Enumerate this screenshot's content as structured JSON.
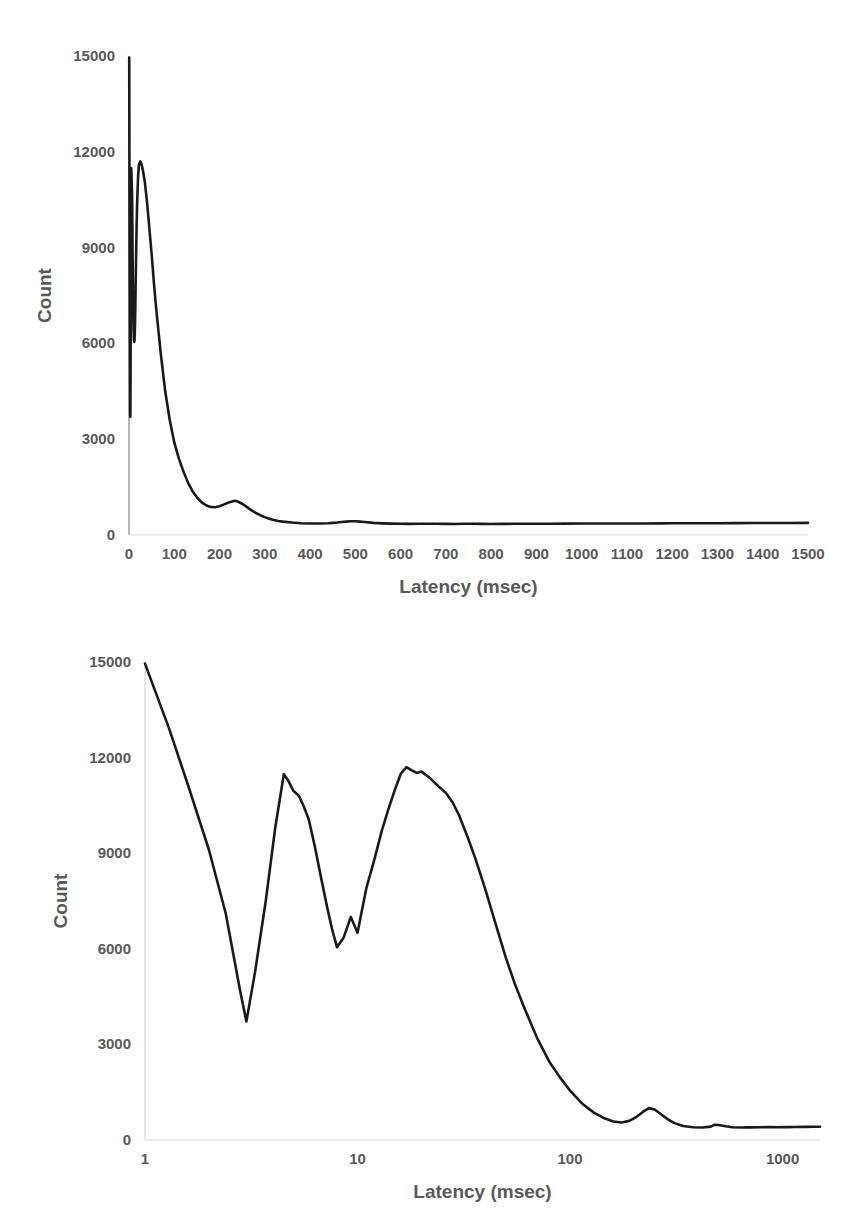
{
  "figures": {
    "top": {
      "name": "latency-histogram-linear",
      "ylabel": "Count",
      "xlabel": "Latency (msec)",
      "y_ticks": [
        "0",
        "3000",
        "6000",
        "9000",
        "12000",
        "15000"
      ],
      "x_ticks": [
        "0",
        "100",
        "200",
        "300",
        "400",
        "500",
        "600",
        "700",
        "800",
        "900",
        "1000",
        "1100",
        "1200",
        "1300",
        "1400",
        "1500"
      ]
    },
    "bottom": {
      "name": "latency-histogram-log",
      "ylabel": "Count",
      "xlabel": "Latency (msec)",
      "y_ticks": [
        "0",
        "3000",
        "6000",
        "9000",
        "12000",
        "15000"
      ],
      "x_ticks": [
        "1",
        "10",
        "100",
        "1000"
      ]
    }
  },
  "colors": {
    "curve": "#1a1a1a",
    "axis": "#868686",
    "axis_faint": "#d9d9d9",
    "text": "#595959",
    "background": "#ffffff"
  },
  "chart_data": [
    {
      "type": "line",
      "id": "latency-histogram-linear",
      "title": "",
      "xlabel": "Latency (msec)",
      "ylabel": "Count",
      "xscale": "linear",
      "yscale": "linear",
      "xlim": [
        0,
        1500
      ],
      "ylim": [
        0,
        15000
      ],
      "xticks": [
        0,
        100,
        200,
        300,
        400,
        500,
        600,
        700,
        800,
        900,
        1000,
        1100,
        1200,
        1300,
        1400,
        1500
      ],
      "yticks": [
        0,
        3000,
        6000,
        9000,
        12000,
        15000
      ],
      "grid": false,
      "legend": null,
      "series": [
        {
          "name": "Count vs Latency (linear axis)",
          "x": [
            0.5,
            1,
            1.5,
            2,
            2.5,
            3,
            3.5,
            4,
            4.5,
            5,
            5.5,
            6,
            6.5,
            7,
            7.5,
            8,
            9,
            10,
            11,
            12,
            13,
            14,
            15,
            16,
            17,
            18,
            20,
            22,
            25,
            28,
            31,
            35,
            40,
            45,
            50,
            55,
            60,
            70,
            80,
            90,
            100,
            110,
            120,
            130,
            140,
            150,
            160,
            170,
            180,
            190,
            200,
            210,
            220,
            230,
            235,
            240,
            250,
            260,
            270,
            280,
            290,
            300,
            310,
            320,
            330,
            340,
            360,
            380,
            400,
            420,
            440,
            450,
            460,
            470,
            480,
            490,
            500,
            510,
            520,
            540,
            560,
            580,
            600,
            620,
            640,
            660,
            680,
            700,
            720,
            740,
            760,
            780,
            800,
            820,
            850,
            880,
            900,
            930,
            960,
            1000,
            1040,
            1080,
            1100,
            1140,
            1180,
            1200,
            1240,
            1280,
            1300,
            1340,
            1380,
            1420,
            1460,
            1500
          ],
          "y": [
            14950,
            11200,
            8100,
            5950,
            3750,
            3700,
            5200,
            7600,
            10100,
            11480,
            11300,
            10950,
            10800,
            10400,
            9600,
            8700,
            7300,
            6500,
            6100,
            6050,
            6400,
            7200,
            8100,
            9000,
            9800,
            10400,
            11200,
            11600,
            11700,
            11600,
            11400,
            11050,
            10400,
            9600,
            8800,
            7900,
            7100,
            5700,
            4500,
            3600,
            2900,
            2400,
            2000,
            1650,
            1380,
            1180,
            1030,
            930,
            880,
            870,
            900,
            960,
            1020,
            1060,
            1070,
            1050,
            980,
            880,
            780,
            690,
            620,
            560,
            510,
            470,
            440,
            420,
            390,
            370,
            360,
            360,
            370,
            380,
            390,
            405,
            420,
            430,
            430,
            420,
            405,
            380,
            365,
            355,
            350,
            348,
            350,
            352,
            350,
            348,
            346,
            350,
            352,
            348,
            346,
            348,
            350,
            352,
            350,
            352,
            355,
            358,
            360,
            362,
            360,
            362,
            365,
            366,
            368,
            370,
            370,
            372,
            375,
            376,
            378,
            380
          ]
        }
      ]
    },
    {
      "type": "line",
      "id": "latency-histogram-log",
      "title": "",
      "xlabel": "Latency (msec)",
      "ylabel": "Count",
      "xscale": "log",
      "yscale": "linear",
      "xlim": [
        1,
        1500
      ],
      "ylim": [
        0,
        15000
      ],
      "xticks": [
        1,
        10,
        100,
        1000
      ],
      "yticks": [
        0,
        3000,
        6000,
        9000,
        12000,
        15000
      ],
      "grid": false,
      "legend": null,
      "series": [
        {
          "name": "Count vs Latency (log axis)",
          "x": [
            1,
            1.3,
            1.6,
            2,
            2.4,
            2.8,
            3.0,
            3.3,
            3.7,
            4.1,
            4.5,
            4.7,
            5.0,
            5.3,
            5.6,
            5.9,
            6.3,
            6.8,
            7.2,
            7.6,
            8.0,
            8.6,
            9.3,
            10,
            11,
            12,
            13,
            14,
            15,
            16,
            17,
            18,
            19,
            20,
            22,
            24,
            26,
            28,
            30,
            33,
            36,
            40,
            45,
            50,
            55,
            60,
            70,
            80,
            90,
            100,
            115,
            130,
            145,
            160,
            175,
            190,
            205,
            220,
            235,
            250,
            270,
            290,
            310,
            340,
            380,
            420,
            460,
            480,
            500,
            540,
            580,
            640,
            700,
            780,
            860,
            950,
            1050,
            1150,
            1280,
            1400,
            1500
          ],
          "y": [
            14950,
            12900,
            11100,
            9100,
            7100,
            4700,
            3720,
            5300,
            7500,
            9800,
            11480,
            11300,
            10950,
            10800,
            10450,
            10050,
            9200,
            8100,
            7300,
            6600,
            6050,
            6350,
            7000,
            6500,
            7900,
            8800,
            9700,
            10400,
            11000,
            11500,
            11700,
            11600,
            11520,
            11560,
            11350,
            11100,
            10900,
            10600,
            10200,
            9500,
            8800,
            7850,
            6700,
            5700,
            4900,
            4250,
            3200,
            2450,
            1950,
            1550,
            1120,
            850,
            680,
            580,
            550,
            600,
            720,
            880,
            1000,
            960,
            790,
            640,
            530,
            440,
            400,
            390,
            420,
            480,
            470,
            430,
            400,
            390,
            395,
            400,
            405,
            400,
            405,
            410,
            412,
            415,
            418
          ]
        }
      ]
    }
  ]
}
